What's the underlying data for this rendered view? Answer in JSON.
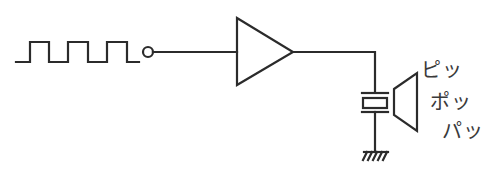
{
  "diagram": {
    "type": "circuit-schematic",
    "components": [
      {
        "id": "square-wave-source",
        "kind": "square wave input signal"
      },
      {
        "id": "input-terminal",
        "kind": "open circle terminal"
      },
      {
        "id": "buffer-amplifier",
        "kind": "triangle amplifier/buffer"
      },
      {
        "id": "piezo-element",
        "kind": "piezoelectric crystal"
      },
      {
        "id": "ground",
        "kind": "chassis ground"
      },
      {
        "id": "speaker",
        "kind": "speaker/sound output"
      }
    ],
    "sound_labels": [
      "ピッ",
      "ポッ",
      "パッ"
    ]
  },
  "colors": {
    "line": "#2b2b2b",
    "text": "#3a3a3a",
    "background": "#ffffff"
  }
}
